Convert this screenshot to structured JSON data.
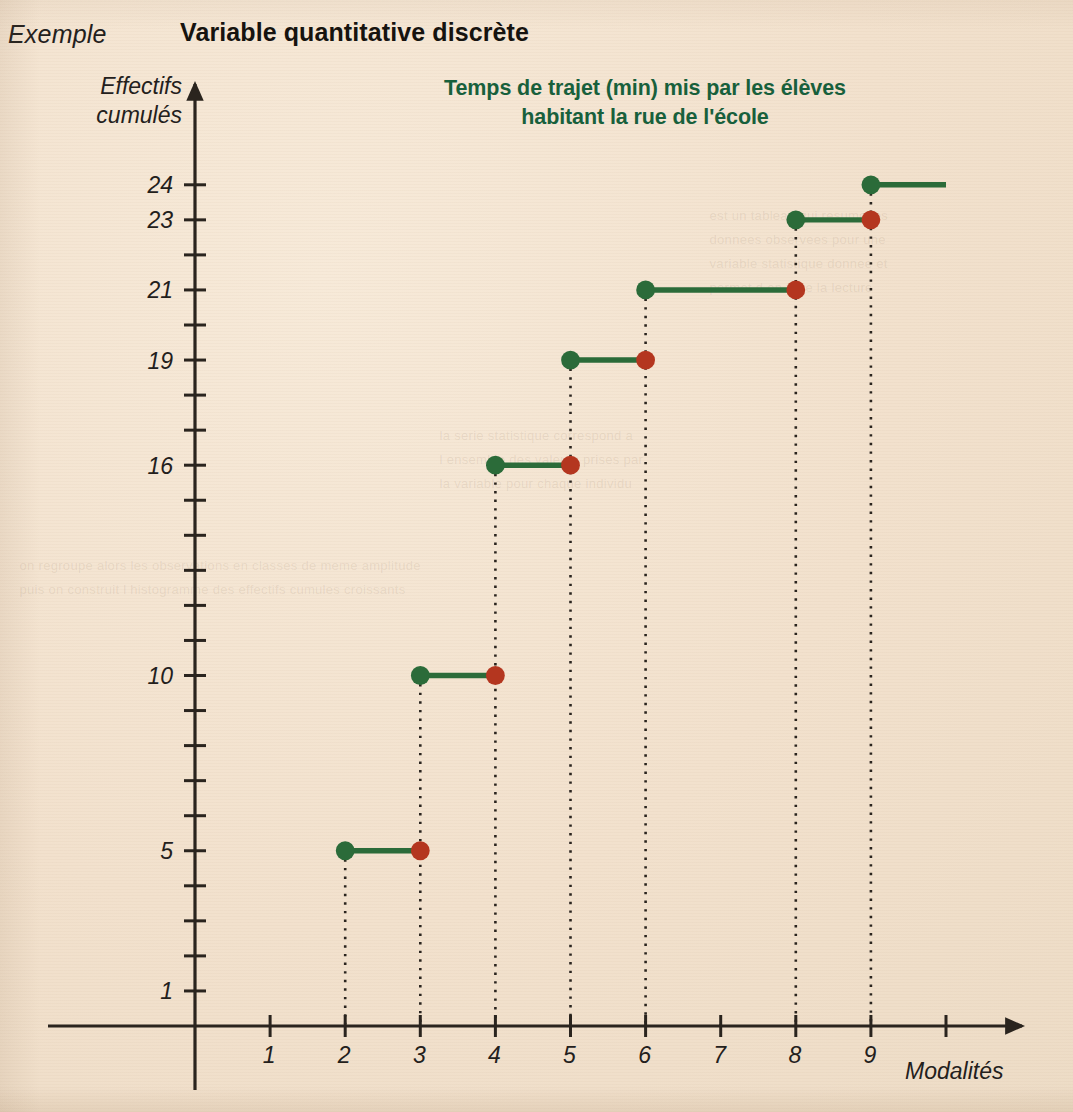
{
  "header": {
    "exemple_label": "Exemple",
    "section_title": "Variable quantitative discrète"
  },
  "chart_data": {
    "type": "line",
    "subtype": "step-cumulative-frequency",
    "title_line1": "Temps de trajet (min) mis par les élèves",
    "title_line2": "habitant la rue de l'école",
    "title": "Temps de trajet (min) mis par les élèves habitant la rue de l'école",
    "xlabel": "Modalités",
    "ylabel": "Effectifs cumulés",
    "ylabel_line1": "Effectifs",
    "ylabel_line2": "cumulés",
    "grid": false,
    "dotted_drop_lines": true,
    "legend": "none",
    "xlim": [
      0,
      10.6
    ],
    "ylim": [
      0,
      25.3
    ],
    "x_ticks": [
      1,
      2,
      3,
      4,
      5,
      6,
      7,
      8,
      9,
      10
    ],
    "x_tick_labels": [
      "1",
      "2",
      "3",
      "4",
      "5",
      "6",
      "7",
      "8",
      "9",
      ""
    ],
    "y_ticks": [
      1,
      2,
      3,
      4,
      5,
      6,
      7,
      8,
      9,
      10,
      11,
      12,
      13,
      14,
      15,
      16,
      17,
      18,
      19,
      20,
      21,
      22,
      23,
      24
    ],
    "y_labeled_ticks": [
      1,
      5,
      10,
      16,
      19,
      21,
      23,
      24
    ],
    "y_tick_labels": [
      "1",
      "5",
      "10",
      "16",
      "19",
      "21",
      "23",
      "24"
    ],
    "categories": [
      2,
      3,
      4,
      5,
      6,
      8,
      9
    ],
    "values": [
      5,
      10,
      16,
      19,
      21,
      23,
      24
    ],
    "steps": [
      {
        "x_start": 2,
        "x_end": 3,
        "y": 5,
        "closed_left": true,
        "closed_right": false
      },
      {
        "x_start": 3,
        "x_end": 4,
        "y": 10,
        "closed_left": true,
        "closed_right": false
      },
      {
        "x_start": 4,
        "x_end": 5,
        "y": 16,
        "closed_left": true,
        "closed_right": false
      },
      {
        "x_start": 5,
        "x_end": 6,
        "y": 19,
        "closed_left": true,
        "closed_right": false
      },
      {
        "x_start": 6,
        "x_end": 8,
        "y": 21,
        "closed_left": true,
        "closed_right": false
      },
      {
        "x_start": 8,
        "x_end": 9,
        "y": 23,
        "closed_left": true,
        "closed_right": false
      },
      {
        "x_start": 9,
        "x_end": 10,
        "y": 24,
        "closed_left": true,
        "closed_right": false
      }
    ],
    "drop_lines_x": [
      2,
      3,
      4,
      5,
      6,
      7,
      8,
      9
    ],
    "colors": {
      "line": "#2b6b39",
      "closed_point": "#2b6b39",
      "open_point": "#b4361f",
      "axis": "#2a241e",
      "title": "#18603c",
      "background": "#f3e3d0",
      "text": "#23201c"
    }
  }
}
